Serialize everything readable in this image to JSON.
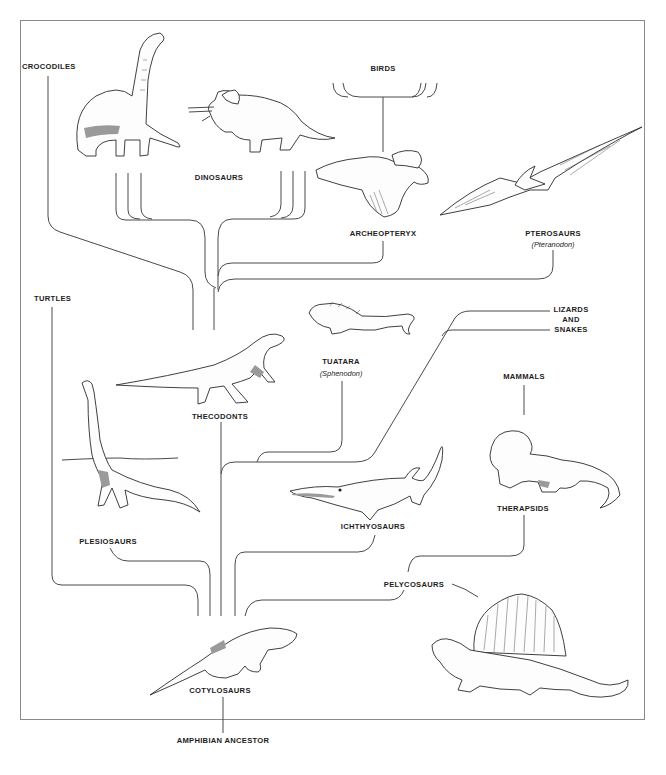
{
  "diagram": {
    "type": "phylogenetic-tree",
    "root": "Amphibian Ancestor",
    "labels": {
      "crocodiles": "CROCODILES",
      "birds": "BIRDS",
      "dinosaurs": "DINOSAURS",
      "archeopteryx": "ARCHEOPTERYX",
      "pterosaurs": "PTEROSAURS",
      "pterosaurs_example": "(Pteranodon)",
      "turtles": "TURTLES",
      "tuatara": "TUATARA",
      "tuatara_example": "(Sphenodon)",
      "lizards_line1": "LIZARDS",
      "lizards_line2": "AND",
      "lizards_line3": "SNAKES",
      "mammals": "MAMMALS",
      "thecodonts": "THECODONTS",
      "therapsids": "THERAPSIDS",
      "ichthyosaurs": "ICHTHYOSAURS",
      "plesiosaurs": "PLESIOSAURS",
      "pelycosaurs": "PELYCOSAURS",
      "cotylosaurs": "COTYLOSAURS",
      "amphibian_ancestor": "AMPHIBIAN  ANCESTOR"
    },
    "illustrations": [
      "brachiosaurus",
      "triceratops",
      "archeopteryx",
      "pteranodon",
      "tuatara",
      "thecodont",
      "plesiosaur",
      "ichthyosaur",
      "therapsid",
      "cotylosaur",
      "dimetrodon"
    ],
    "edges": [
      [
        "Amphibian Ancestor",
        "Cotylosaurs"
      ],
      [
        "Cotylosaurs",
        "Turtles"
      ],
      [
        "Cotylosaurs",
        "Plesiosaurs"
      ],
      [
        "Cotylosaurs",
        "Thecodonts"
      ],
      [
        "Cotylosaurs",
        "Ichthyosaurs"
      ],
      [
        "Cotylosaurs",
        "Pelycosaurs"
      ],
      [
        "Pelycosaurs",
        "Therapsids"
      ],
      [
        "Therapsids",
        "Mammals"
      ],
      [
        "Thecodonts",
        "Tuatara"
      ],
      [
        "Thecodonts",
        "Lizards and Snakes"
      ],
      [
        "Thecodonts",
        "Crocodiles"
      ],
      [
        "Thecodonts",
        "Dinosaurs"
      ],
      [
        "Thecodonts",
        "Archeopteryx"
      ],
      [
        "Thecodonts",
        "Pterosaurs"
      ],
      [
        "Archeopteryx",
        "Birds"
      ]
    ]
  }
}
